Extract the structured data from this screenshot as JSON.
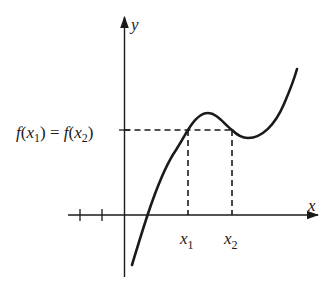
{
  "diagram": {
    "type": "function-graph",
    "colors": {
      "background": "#ffffff",
      "ink": "#1a1a1a"
    },
    "axes": {
      "x_label": "x",
      "y_label": "y",
      "negative_x_ticks": 2
    },
    "labels": {
      "level_lhs_f": "f",
      "level_lhs_open": "(",
      "level_lhs_x": "x",
      "level_lhs_sub": "1",
      "level_lhs_close": ")",
      "level_eq": " = ",
      "level_rhs_f": "f",
      "level_rhs_open": "(",
      "level_rhs_x": "x",
      "level_rhs_sub": "2",
      "level_rhs_close": ")",
      "x1_main": "x",
      "x1_sub": "1",
      "x2_main": "x",
      "x2_sub": "2"
    },
    "annotations": {
      "level_line": "f(x1) = f(x2)",
      "marked_points": [
        "x1",
        "x2"
      ]
    }
  }
}
